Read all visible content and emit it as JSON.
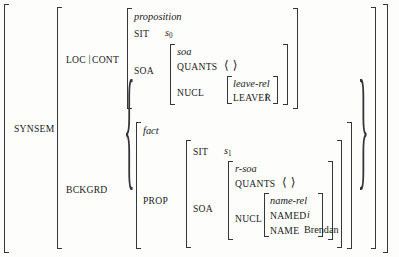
{
  "figure": {
    "kind": "attribute-value-matrix",
    "notation": "HPSG / situation semantics feature structure"
  },
  "labels": {
    "synsem": "SYNSEM",
    "loc_cont": "LOC|CONT",
    "loc": "LOC",
    "bar": "|",
    "cont": "CONT",
    "bckgrd": "BCKGRD",
    "prop": "PROP",
    "sit": "SIT",
    "soa": "SOA",
    "quants": "QUANTS",
    "nucl": "NUCL",
    "leaver": "LEAVER",
    "named": "NAMED",
    "name": "NAME"
  },
  "types": {
    "proposition": "proposition",
    "soa": "soa",
    "leave_rel": "leave-rel",
    "fact": "fact",
    "r_soa": "r-soa",
    "name_rel": "name-rel"
  },
  "values": {
    "sit_0": "s",
    "sit_0_sub": "0",
    "sit_1": "s",
    "sit_1_sub": "1",
    "empty_list": "⟨ ⟩",
    "index_leaver": "i",
    "index_named": "i",
    "name_brendan": "Brendan"
  },
  "colors": {
    "ink": "#1a1a1a",
    "rule": "#35353a",
    "background": "#fdfdfb"
  }
}
